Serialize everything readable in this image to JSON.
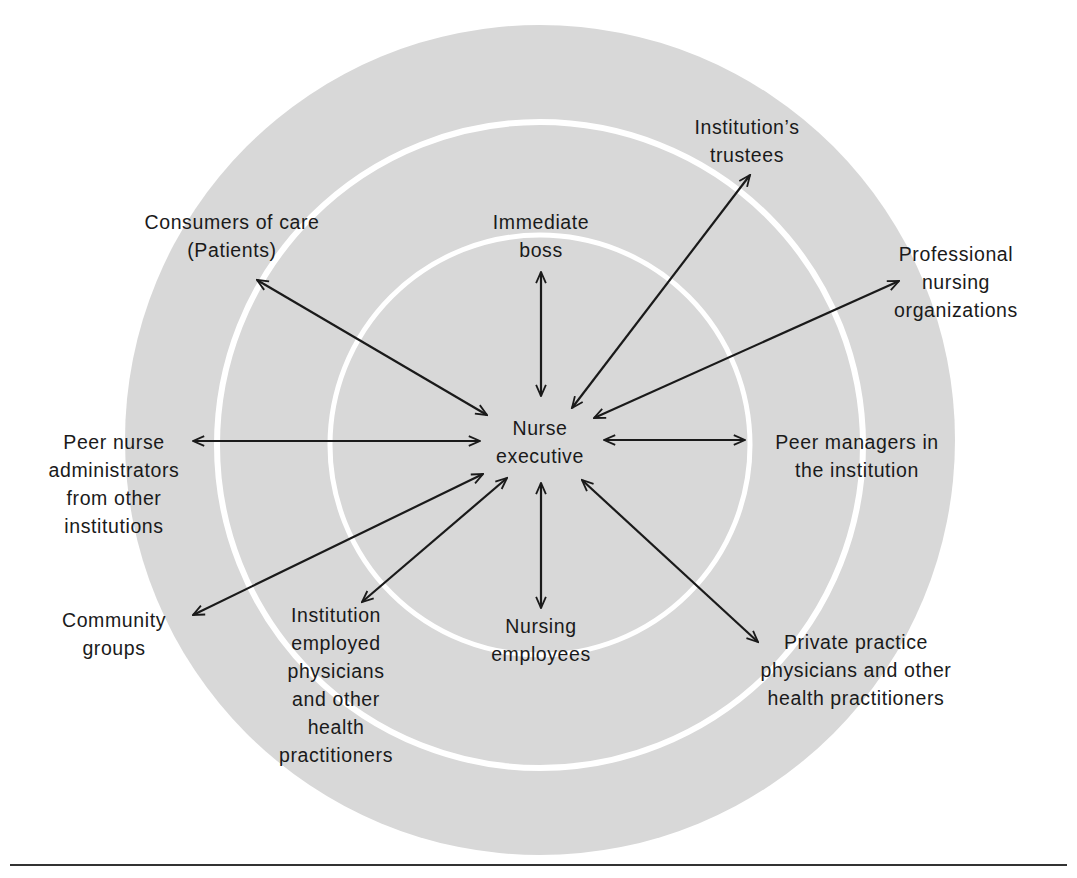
{
  "figure": {
    "colors": {
      "ring_fill": "#d8d8d8",
      "ring_separator": "#ffffff",
      "arrow": "#1a1a1a",
      "text": "#1a1a1a",
      "rule": "#333333"
    },
    "center": {
      "label": "Nurse\nexecutive"
    },
    "nodes": [
      {
        "id": "immediate-boss",
        "label": "Immediate\nboss"
      },
      {
        "id": "institutions-trustees",
        "label": "Institution’s\ntrustees"
      },
      {
        "id": "professional-nursing-organizations",
        "label": "Professional\nnursing\norganizations"
      },
      {
        "id": "peer-managers",
        "label": "Peer managers in\nthe institution"
      },
      {
        "id": "private-practice-physicians",
        "label": "Private practice\nphysicians and other\nhealth practitioners"
      },
      {
        "id": "nursing-employees",
        "label": "Nursing\nemployees"
      },
      {
        "id": "institution-employed-physicians",
        "label": "Institution\nemployed\nphysicians\nand other\nhealth\npractitioners"
      },
      {
        "id": "community-groups",
        "label": "Community\ngroups"
      },
      {
        "id": "peer-nurse-administrators",
        "label": "Peer nurse\nadministrators\nfrom other\ninstitutions"
      },
      {
        "id": "consumers-of-care",
        "label": "Consumers of care\n(Patients)"
      }
    ],
    "rings": [
      "inner",
      "middle",
      "outer"
    ]
  }
}
